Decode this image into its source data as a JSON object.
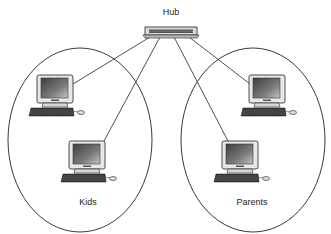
{
  "diagram": {
    "hub": {
      "label": "Hub"
    },
    "groups": [
      {
        "label": "Kids",
        "computers": 2
      },
      {
        "label": "Parents",
        "computers": 2
      }
    ],
    "colors": {
      "line": "#222222",
      "screen_dark": "#4a4a4a",
      "screen_light": "#bdbdbd",
      "case": "#e6e6e6"
    }
  }
}
